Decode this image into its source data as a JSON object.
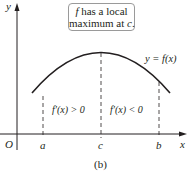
{
  "figure": {
    "caption": "(b)",
    "annotation": {
      "line1_italic": "f",
      "line1_rest": " has a local",
      "line2_rest": "maximum at ",
      "line2_italic": "c",
      "line2_end": "."
    },
    "axes": {
      "x_label": "x",
      "y_label": "y",
      "origin_label": "O"
    },
    "ticks": [
      {
        "label": "a"
      },
      {
        "label": "c"
      },
      {
        "label": "b"
      }
    ],
    "curve_label": "y = f(x)",
    "region_labels": [
      {
        "text": "f′(x) > 0"
      },
      {
        "text": "f′(x) < 0"
      }
    ],
    "colors": {
      "curve": "#231f20",
      "axis": "#231f20",
      "dashed": "#231f20",
      "box_border": "#9a9a9a"
    }
  }
}
